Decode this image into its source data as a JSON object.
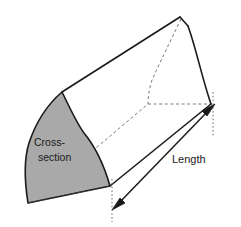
{
  "figure": {
    "type": "prism-diagram",
    "title_visible": false,
    "background_color": "#ffffff",
    "outline_color": "#1a1a1a",
    "hidden_edge_color": "#6b6b6b",
    "cross_section_fill": "#a9a9a9",
    "body_fill": "#ffffff",
    "labels": {
      "cross_section_line1": "Cross-",
      "cross_section_line2": "section",
      "length": "Length"
    },
    "annotations": {
      "length_dimension": {
        "label": "Length",
        "arrow_style": "double-headed",
        "extension_lines": "dotted"
      },
      "cross_section_region": {
        "label": "Cross-section",
        "shading": "gray",
        "position": "front-left-face"
      }
    },
    "icons": {
      "arrowhead_start": "arrow-down-left-icon",
      "arrowhead_end": "arrow-up-right-icon"
    }
  }
}
